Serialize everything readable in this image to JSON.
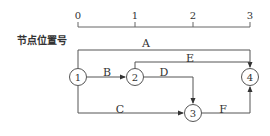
{
  "axis": {
    "label": "节点位置号",
    "ticks": [
      {
        "value": "0",
        "x": 78
      },
      {
        "value": "1",
        "x": 135
      },
      {
        "value": "2",
        "x": 193
      },
      {
        "value": "3",
        "x": 250
      }
    ]
  },
  "nodes": [
    {
      "id": "1",
      "x": 78,
      "y": 77
    },
    {
      "id": "2",
      "x": 135,
      "y": 77
    },
    {
      "id": "3",
      "x": 193,
      "y": 113
    },
    {
      "id": "4",
      "x": 250,
      "y": 77
    }
  ],
  "activities": [
    {
      "name": "A",
      "from": "1",
      "to": "4"
    },
    {
      "name": "B",
      "from": "1",
      "to": "2"
    },
    {
      "name": "C",
      "from": "1",
      "to": "3"
    },
    {
      "name": "D",
      "from": "2",
      "to": "3"
    },
    {
      "name": "E",
      "from": "2",
      "to": "4"
    },
    {
      "name": "F",
      "from": "3",
      "to": "4"
    }
  ],
  "colors": {
    "line": "#555555",
    "text": "#333333",
    "background": "#ffffff"
  }
}
